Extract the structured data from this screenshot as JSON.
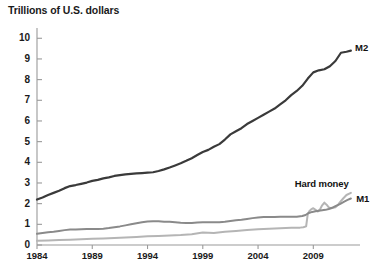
{
  "chart_data": {
    "type": "line",
    "title": "Trillions of U.S. dollars",
    "xlabel": "",
    "ylabel": "Trillions of U.S. dollars",
    "xlim": [
      1984,
      2012.5
    ],
    "ylim": [
      0,
      10.4
    ],
    "grid": false,
    "legend_position": "inline-right",
    "xticks": [
      "1984",
      "1989",
      "1994",
      "1999",
      "2004",
      "2009"
    ],
    "xtick_values": [
      1984,
      1989,
      1994,
      1999,
      2004,
      2009
    ],
    "yticks": [
      "0",
      "1",
      "2",
      "3",
      "4",
      "5",
      "6",
      "7",
      "8",
      "9",
      "10"
    ],
    "ytick_values": [
      0,
      1,
      2,
      3,
      4,
      5,
      6,
      7,
      8,
      9,
      10
    ],
    "colors": {
      "m2": "#3a3a3a",
      "m1": "#8a8a8a",
      "hard_money": "#b5b5b5",
      "axis": "#9a9a9a",
      "text": "#1a1a1a"
    },
    "series": [
      {
        "name": "M2",
        "label": "M2",
        "color": "#3a3a3a",
        "width": 2.2,
        "x": [
          1984.0,
          1984.5,
          1985.0,
          1985.5,
          1986.0,
          1986.5,
          1987.0,
          1987.5,
          1988.0,
          1988.5,
          1989.0,
          1989.5,
          1990.0,
          1990.5,
          1991.0,
          1991.5,
          1992.0,
          1992.5,
          1993.0,
          1993.5,
          1994.0,
          1994.5,
          1995.0,
          1995.5,
          1996.0,
          1996.5,
          1997.0,
          1997.5,
          1998.0,
          1998.5,
          1999.0,
          1999.5,
          2000.0,
          2000.5,
          2001.0,
          2001.5,
          2002.0,
          2002.5,
          2003.0,
          2003.5,
          2004.0,
          2004.5,
          2005.0,
          2005.5,
          2006.0,
          2006.5,
          2007.0,
          2007.5,
          2008.0,
          2008.5,
          2009.0,
          2009.5,
          2010.0,
          2010.5,
          2011.0,
          2011.5,
          2012.0,
          2012.4
        ],
        "values": [
          2.2,
          2.3,
          2.42,
          2.52,
          2.62,
          2.75,
          2.85,
          2.9,
          2.96,
          3.02,
          3.1,
          3.15,
          3.22,
          3.27,
          3.34,
          3.38,
          3.42,
          3.44,
          3.46,
          3.48,
          3.5,
          3.52,
          3.58,
          3.66,
          3.75,
          3.85,
          3.95,
          4.07,
          4.2,
          4.35,
          4.5,
          4.6,
          4.75,
          4.88,
          5.1,
          5.35,
          5.5,
          5.65,
          5.85,
          6.0,
          6.15,
          6.3,
          6.45,
          6.6,
          6.8,
          7.0,
          7.25,
          7.45,
          7.7,
          8.05,
          8.35,
          8.45,
          8.5,
          8.65,
          8.9,
          9.3,
          9.35,
          9.4
        ]
      },
      {
        "name": "M1",
        "label": "M1",
        "color": "#8a8a8a",
        "width": 2.0,
        "x": [
          1984.0,
          1984.5,
          1985.0,
          1985.5,
          1986.0,
          1986.5,
          1987.0,
          1987.5,
          1988.0,
          1988.5,
          1989.0,
          1989.5,
          1990.0,
          1990.5,
          1991.0,
          1991.5,
          1992.0,
          1992.5,
          1993.0,
          1993.5,
          1994.0,
          1994.5,
          1995.0,
          1995.5,
          1996.0,
          1996.5,
          1997.0,
          1997.5,
          1998.0,
          1998.5,
          1999.0,
          1999.5,
          2000.0,
          2000.5,
          2001.0,
          2001.5,
          2002.0,
          2002.5,
          2003.0,
          2003.5,
          2004.0,
          2004.5,
          2005.0,
          2005.5,
          2006.0,
          2006.5,
          2007.0,
          2007.5,
          2008.0,
          2008.3,
          2008.6,
          2008.9,
          2009.2,
          2009.5,
          2009.8,
          2010.1,
          2010.4,
          2010.7,
          2011.0,
          2011.4,
          2011.8,
          2012.1,
          2012.4
        ],
        "values": [
          0.54,
          0.58,
          0.62,
          0.64,
          0.68,
          0.72,
          0.75,
          0.75,
          0.76,
          0.77,
          0.78,
          0.77,
          0.79,
          0.82,
          0.86,
          0.9,
          0.95,
          1.0,
          1.05,
          1.1,
          1.14,
          1.15,
          1.15,
          1.13,
          1.12,
          1.1,
          1.08,
          1.07,
          1.07,
          1.09,
          1.1,
          1.1,
          1.1,
          1.1,
          1.12,
          1.16,
          1.2,
          1.22,
          1.26,
          1.3,
          1.33,
          1.35,
          1.36,
          1.36,
          1.37,
          1.37,
          1.37,
          1.37,
          1.4,
          1.45,
          1.55,
          1.6,
          1.63,
          1.66,
          1.68,
          1.7,
          1.74,
          1.8,
          1.88,
          1.98,
          2.1,
          2.18,
          2.25
        ]
      },
      {
        "name": "Hard money",
        "label": "Hard money",
        "color": "#b5b5b5",
        "width": 2.0,
        "x": [
          1984.0,
          1985.0,
          1986.0,
          1987.0,
          1988.0,
          1989.0,
          1990.0,
          1991.0,
          1992.0,
          1993.0,
          1994.0,
          1995.0,
          1996.0,
          1997.0,
          1998.0,
          1999.0,
          2000.0,
          2001.0,
          2002.0,
          2003.0,
          2004.0,
          2005.0,
          2006.0,
          2007.0,
          2007.8,
          2008.1,
          2008.35,
          2008.5,
          2008.65,
          2008.8,
          2009.0,
          2009.2,
          2009.4,
          2009.6,
          2009.8,
          2010.0,
          2010.2,
          2010.4,
          2010.6,
          2010.8,
          2011.0,
          2011.2,
          2011.4,
          2011.7,
          2012.0,
          2012.4
        ],
        "values": [
          0.2,
          0.22,
          0.24,
          0.26,
          0.28,
          0.3,
          0.32,
          0.34,
          0.36,
          0.39,
          0.42,
          0.44,
          0.46,
          0.48,
          0.52,
          0.6,
          0.58,
          0.64,
          0.68,
          0.72,
          0.76,
          0.79,
          0.81,
          0.83,
          0.84,
          0.86,
          0.9,
          1.5,
          1.65,
          1.72,
          1.78,
          1.7,
          1.62,
          1.72,
          1.92,
          2.05,
          1.95,
          1.82,
          1.78,
          1.8,
          1.82,
          1.92,
          2.06,
          2.25,
          2.42,
          2.52
        ]
      }
    ],
    "annotations": [
      {
        "text": "M2",
        "x": 2012.6,
        "y": 9.6
      },
      {
        "text": "Hard money",
        "x": 2010.4,
        "y": 3.0
      },
      {
        "text": "M1",
        "x": 2012.7,
        "y": 2.25
      }
    ]
  }
}
